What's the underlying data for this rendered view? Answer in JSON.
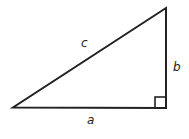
{
  "diagram": {
    "type": "right-triangle",
    "stroke_color": "#222222",
    "labels": {
      "hypotenuse": "c",
      "vertical_leg": "b",
      "horizontal_leg": "a"
    },
    "right_angle_marker": true
  }
}
